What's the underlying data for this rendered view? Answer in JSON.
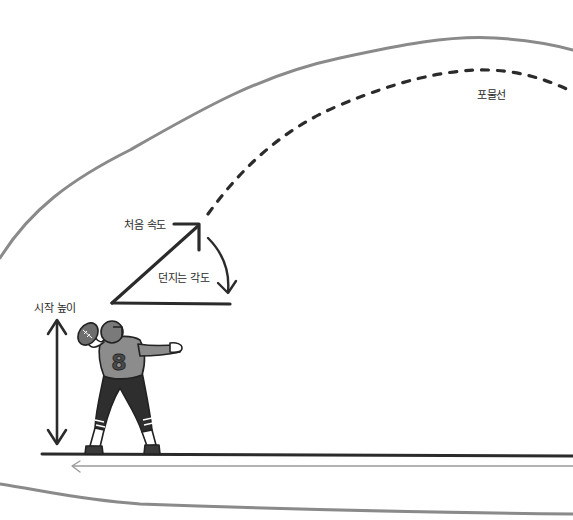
{
  "diagram": {
    "type": "projectile-throw-illustration",
    "labels": {
      "trajectory": "포물선",
      "initial_velocity": "처음 속도",
      "throw_angle": "던지는 각도",
      "start_height": "시작 높이"
    },
    "player": {
      "jersey_number": "8"
    },
    "colors": {
      "background": "#ffffff",
      "outline": "#2b2b2b",
      "boundary_curve": "#8a8a8a",
      "jersey": "#8c8c8c",
      "pants": "#2e2e2e",
      "helmet": "#7a7a7a",
      "ground_arrow": "#9a9a9a"
    }
  }
}
